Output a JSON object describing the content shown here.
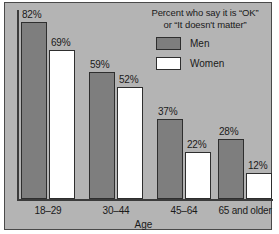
{
  "chart_data": {
    "type": "bar",
    "title_line1": "Percent who say it is “OK”",
    "title_line2": "or “It doesn't matter”",
    "xlabel": "Age",
    "ylabel": "",
    "ylim": [
      0,
      92
    ],
    "grid": false,
    "legend_position": "top-right",
    "categories": [
      "18–29",
      "30–44",
      "45–64",
      "65 and older"
    ],
    "series": [
      {
        "name": "Men",
        "color": "#7e7e7e",
        "values": [
          82,
          59,
          37,
          28
        ],
        "labels": [
          "82%",
          "59%",
          "37%",
          "28%"
        ]
      },
      {
        "name": "Women",
        "color": "#ffffff",
        "values": [
          69,
          52,
          22,
          12
        ],
        "labels": [
          "69%",
          "52%",
          "22%",
          "12%"
        ]
      }
    ]
  },
  "legend": {
    "items": [
      {
        "label": "Men",
        "swatch": "men"
      },
      {
        "label": "Women",
        "swatch": "women"
      }
    ]
  },
  "colors": {
    "background": "#b4b4b4",
    "frame": "#4a4a4a",
    "axis": "#3b3b3b",
    "men_bar": "#7e7e7e",
    "women_bar": "#ffffff",
    "bar_outline": "#2e2e2e",
    "text": "#1a1a1a"
  }
}
